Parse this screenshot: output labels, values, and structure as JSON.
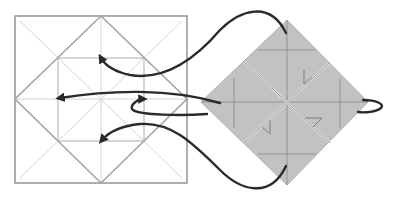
{
  "diagram": {
    "type": "origami-fold-diagram",
    "colors": {
      "background": "#ffffff",
      "square_outline": "#9a9a9a",
      "crease_light": "#d0d0d0",
      "inner_lines": "#a8a8a8",
      "diamond_fill": "#c2c2c2",
      "diamond_lines": "#8f8f8f",
      "arrow": "#2a2a2a"
    },
    "left_square": {
      "outer": {
        "x1": 15,
        "y1": 16,
        "x2": 187,
        "y2": 183
      },
      "diamond_inscribed": true,
      "inner_square": {
        "x1": 58,
        "y1": 58,
        "x2": 144,
        "y2": 141
      }
    },
    "right_diamond": {
      "top": [
        287,
        20
      ],
      "right": [
        368,
        102
      ],
      "bottom": [
        287,
        185
      ],
      "left": [
        201,
        102
      ]
    },
    "arrows": [
      {
        "name": "arrow-top",
        "to": "top-center of inner square"
      },
      {
        "name": "arrow-left",
        "to": "left-center of inner square"
      },
      {
        "name": "arrow-center-right",
        "to": "right side near center"
      },
      {
        "name": "arrow-bottom",
        "to": "bottom-center of inner square"
      },
      {
        "name": "arrow-right-loop",
        "to": "right tip loop"
      }
    ]
  }
}
